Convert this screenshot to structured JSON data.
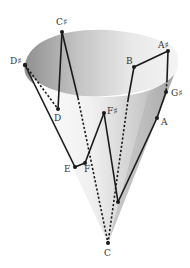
{
  "diagram": {
    "type": "cone-pitch-path",
    "colors": {
      "cone_inner_dark": "#9a9a9a",
      "cone_inner_light": "#e6e6e6",
      "cone_outer_light": "#f2f2f2",
      "cone_outer_dark": "#a8a8a8",
      "line": "#1a1a1a",
      "label": "#333333"
    },
    "points": [
      {
        "id": "Cs",
        "label": "C♯",
        "x": 62,
        "y": 32
      },
      {
        "id": "Ds",
        "label": "D♯",
        "x": 25,
        "y": 65
      },
      {
        "id": "D",
        "label": "D",
        "x": 58,
        "y": 109
      },
      {
        "id": "B",
        "label": "B",
        "x": 134,
        "y": 67
      },
      {
        "id": "As",
        "label": "A♯",
        "x": 168,
        "y": 51
      },
      {
        "id": "Gs",
        "label": "G♯",
        "x": 166,
        "y": 92
      },
      {
        "id": "A",
        "label": "A",
        "x": 157,
        "y": 118
      },
      {
        "id": "Fs",
        "label": "F♯",
        "x": 104,
        "y": 113
      },
      {
        "id": "E",
        "label": "E",
        "x": 75,
        "y": 167
      },
      {
        "id": "F",
        "label": "F",
        "x": 85,
        "y": 163
      },
      {
        "id": "P",
        "label": "",
        "x": 118,
        "y": 202
      },
      {
        "id": "C",
        "label": "C",
        "x": 108,
        "y": 243
      }
    ],
    "labels": {
      "Cs": "C♯",
      "Ds": "D♯",
      "D": "D",
      "B": "B",
      "As": "A♯",
      "Gs": "G♯",
      "A": "A",
      "Fs": "F♯",
      "E": "E",
      "F": "F",
      "C": "C"
    }
  }
}
